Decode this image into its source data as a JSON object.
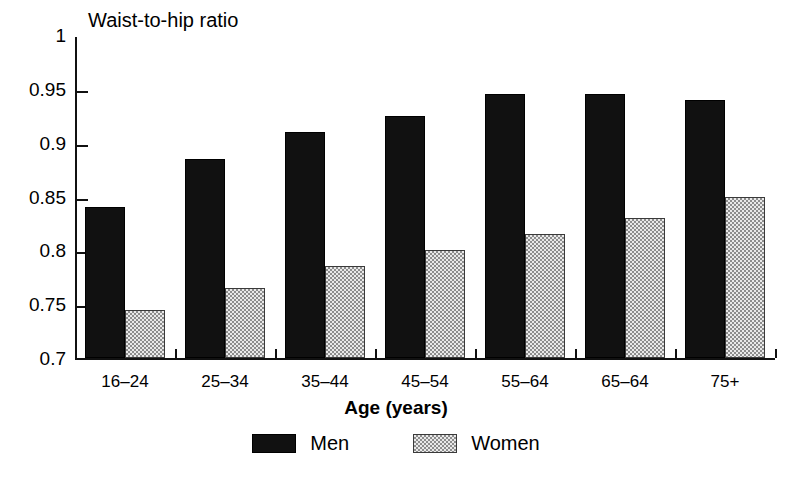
{
  "chart_data": {
    "type": "bar",
    "title": "",
    "ylabel": "Waist-to-hip ratio",
    "xlabel": "Age (years)",
    "categories": [
      "16–24",
      "25–34",
      "35–44",
      "45–54",
      "55–64",
      "65–64",
      "75+"
    ],
    "series": [
      {
        "name": "Men",
        "color": "#111111",
        "values": [
          0.84,
          0.885,
          0.91,
          0.925,
          0.945,
          0.945,
          0.94
        ]
      },
      {
        "name": "Women",
        "color": "#cccccc",
        "values": [
          0.745,
          0.765,
          0.785,
          0.8,
          0.815,
          0.83,
          0.85
        ]
      }
    ],
    "ylim": [
      0.7,
      1.0
    ],
    "ytick_values": [
      1,
      0.95,
      0.9,
      0.85,
      0.8,
      0.75,
      0.7
    ],
    "ytick_labels": [
      "1",
      "0.95",
      "0.9",
      "0.85",
      "0.8",
      "0.75",
      "0.7"
    ],
    "grid": false,
    "legend_position": "bottom-center"
  },
  "legend": {
    "items": [
      {
        "label": "Men",
        "swatch": "black-filled-swatch"
      },
      {
        "label": "Women",
        "swatch": "grey-dotted-swatch"
      }
    ]
  },
  "axes": {
    "y_title": "Waist-to-hip ratio",
    "x_title": "Age (years)"
  }
}
